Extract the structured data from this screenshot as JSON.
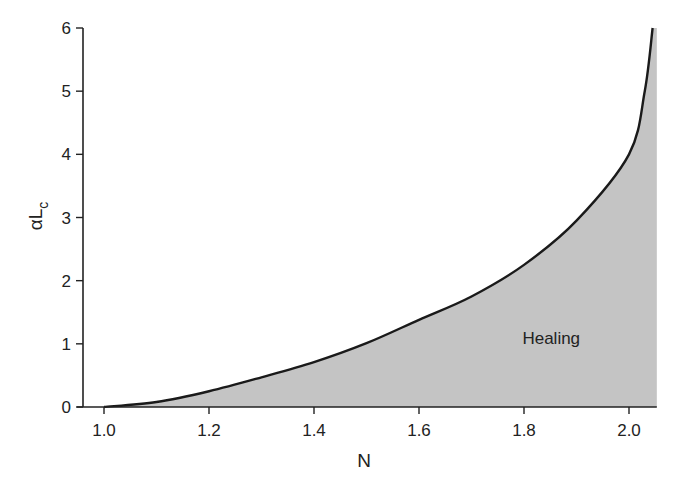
{
  "chart_data": {
    "type": "area",
    "title": "",
    "xlabel": "N",
    "ylabel": "αL_c",
    "ylabel_main": "αL",
    "ylabel_sub": "c",
    "xlim": [
      0.96,
      2.055
    ],
    "ylim": [
      0,
      6
    ],
    "xticks": [
      "1.0",
      "1.2",
      "1.4",
      "1.6",
      "1.8",
      "2.0"
    ],
    "xtick_values": [
      1.0,
      1.2,
      1.4,
      1.6,
      1.8,
      2.0
    ],
    "yticks": [
      "0",
      "1",
      "2",
      "3",
      "4",
      "5",
      "6"
    ],
    "ytick_values": [
      0,
      1,
      2,
      3,
      4,
      5,
      6
    ],
    "grid": false,
    "legend": null,
    "series": [
      {
        "name": "critical αL_c boundary",
        "x": [
          1.0,
          1.1,
          1.2,
          1.3,
          1.4,
          1.5,
          1.6,
          1.7,
          1.8,
          1.9,
          2.0,
          2.03,
          2.045
        ],
        "values": [
          0,
          0.08,
          0.25,
          0.47,
          0.71,
          1.01,
          1.38,
          1.75,
          2.25,
          2.95,
          4.0,
          5.0,
          6.0
        ],
        "fill": "below",
        "fill_color": "#c4c4c4",
        "line_color": "#1a1a1a"
      }
    ],
    "annotations": [
      {
        "text": "Healing",
        "x": 1.85,
        "y": 1.1
      }
    ],
    "fill_right_edge_x": 2.053
  },
  "colors": {
    "fill": "#c4c4c4",
    "line": "#1a1a1a",
    "axis": "#222222",
    "background": "#ffffff"
  }
}
